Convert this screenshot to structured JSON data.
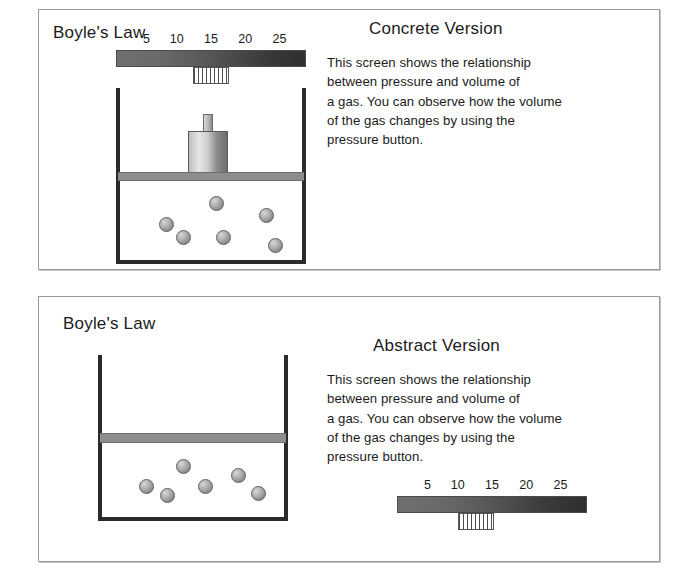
{
  "figure": {
    "panels": [
      {
        "id": "concrete",
        "screen_title": "Boyle's Law",
        "version_title": "Concrete Version",
        "body_text": "This screen shows the relationship\nbetween pressure and volume of\na gas. You can observe how the volume\nof the gas changes by using the\npressure button.",
        "slider": {
          "label": "pressure-slider",
          "ticks": [
            "5",
            "10",
            "15",
            "20",
            "25"
          ],
          "thumb_value": "15",
          "track_gradient_from": "#6f6f6f",
          "track_gradient_to": "#2f2f2f"
        },
        "container": {
          "has_weight": true,
          "molecule_count": 6,
          "molecule_color": "#9a9a9a",
          "wall_color": "#2b2b2b",
          "piston_color": "#8d8d8d"
        }
      },
      {
        "id": "abstract",
        "screen_title": "Boyle's Law",
        "version_title": "Abstract Version",
        "body_text": "This screen shows the relationship\nbetween pressure and volume of\na gas. You can observe how the volume\nof the gas changes by using the\npressure button.",
        "slider": {
          "label": "pressure-slider",
          "ticks": [
            "5",
            "10",
            "15",
            "20",
            "25"
          ],
          "thumb_value": "13",
          "track_gradient_from": "#6f6f6f",
          "track_gradient_to": "#2f2f2f"
        },
        "container": {
          "has_weight": false,
          "molecule_count": 6,
          "molecule_color": "#9a9a9a",
          "wall_color": "#2b2b2b",
          "piston_color": "#8d8d8d"
        }
      }
    ]
  }
}
